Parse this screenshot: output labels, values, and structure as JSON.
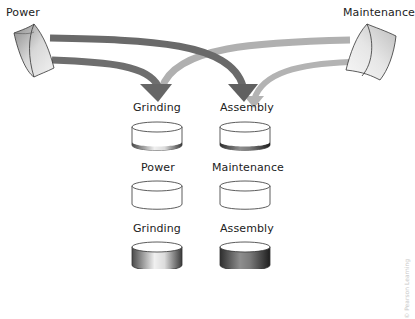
{
  "sources": {
    "power": {
      "label": "Power"
    },
    "maintenance": {
      "label": "Maintenance"
    }
  },
  "rows": [
    {
      "name": "allocated-departments",
      "items": [
        {
          "label": "Grinding",
          "fill": "thin-band"
        },
        {
          "label": "Assembly",
          "fill": "thin-band"
        }
      ]
    },
    {
      "name": "service-departments",
      "items": [
        {
          "label": "Power",
          "fill": "empty"
        },
        {
          "label": "Maintenance",
          "fill": "empty"
        }
      ]
    },
    {
      "name": "production-departments",
      "items": [
        {
          "label": "Grinding",
          "fill": "full"
        },
        {
          "label": "Assembly",
          "fill": "full"
        }
      ]
    }
  ],
  "arrows": [
    {
      "from": "Power",
      "to": "Grinding",
      "shade": "dark"
    },
    {
      "from": "Power",
      "to": "Assembly",
      "shade": "dark"
    },
    {
      "from": "Maintenance",
      "to": "Grinding",
      "shade": "light"
    },
    {
      "from": "Maintenance",
      "to": "Assembly",
      "shade": "light"
    }
  ],
  "colors": {
    "dark_arrow": "#6a6a6a",
    "light_arrow": "#b0b0b0",
    "outline": "#333333"
  },
  "watermark": "© Pearson Learning"
}
